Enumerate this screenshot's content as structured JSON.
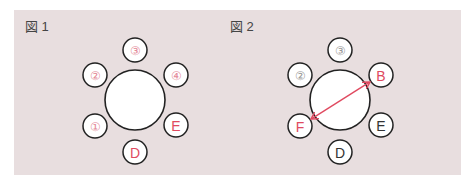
{
  "colors": {
    "panel_bg": "#e8dedf",
    "highlight": "#e04a60",
    "normal": "#333333",
    "muted": "#999999",
    "faint_red": "#e48a98"
  },
  "figures": [
    {
      "label": "図 1",
      "seats": [
        {
          "id": "top",
          "text": "③",
          "style": "faint_red"
        },
        {
          "id": "upper-left",
          "text": "②",
          "style": "faint_red"
        },
        {
          "id": "upper-right",
          "text": "④",
          "style": "faint_red"
        },
        {
          "id": "lower-left",
          "text": "①",
          "style": "faint_red"
        },
        {
          "id": "lower-right",
          "text": "E",
          "style": "highlight"
        },
        {
          "id": "bottom",
          "text": "D",
          "style": "highlight"
        }
      ],
      "arrow": false
    },
    {
      "label": "図 2",
      "seats": [
        {
          "id": "top",
          "text": "③",
          "style": "muted"
        },
        {
          "id": "upper-left",
          "text": "②",
          "style": "muted"
        },
        {
          "id": "upper-right",
          "text": "B",
          "style": "highlight"
        },
        {
          "id": "lower-left",
          "text": "F",
          "style": "highlight"
        },
        {
          "id": "lower-right",
          "text": "E",
          "style": "normal"
        },
        {
          "id": "bottom",
          "text": "D",
          "style": "normal"
        }
      ],
      "arrow": true,
      "arrow_between": [
        "B",
        "F"
      ]
    }
  ]
}
